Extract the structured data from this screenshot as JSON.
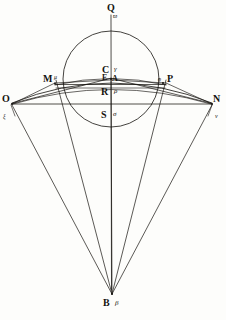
{
  "figure": {
    "background_color": "#fdfdfb",
    "ink_color": "#15130f",
    "width": 226,
    "height": 320
  },
  "points": {
    "Q": {
      "latin": "Q",
      "greek": "ϖ"
    },
    "C": {
      "latin": "C",
      "greek": "γ"
    },
    "E": {
      "latin": "E",
      "greek": ""
    },
    "A": {
      "latin": "A",
      "greek": ""
    },
    "M": {
      "latin": "M",
      "greek": "μ"
    },
    "P": {
      "latin": "P",
      "greek": "ϱ"
    },
    "R": {
      "latin": "R",
      "greek": "ρ"
    },
    "S": {
      "latin": "S",
      "greek": "σ"
    },
    "O": {
      "latin": "O",
      "greek": "ξ"
    },
    "N": {
      "latin": "N",
      "greek": "ν"
    },
    "B": {
      "latin": "B",
      "greek": "β"
    }
  },
  "labels": [
    {
      "id": "label-Q",
      "latin": "Q",
      "greek": "ϖ"
    },
    {
      "id": "label-C",
      "latin": "C",
      "greek": "γ"
    },
    {
      "id": "label-E",
      "latin": "E",
      "greek": ""
    },
    {
      "id": "label-A",
      "latin": "A",
      "greek": ""
    },
    {
      "id": "label-M",
      "latin": "M",
      "greek": "μ"
    },
    {
      "id": "label-P",
      "latin": "P",
      "greek": "ϱ"
    },
    {
      "id": "label-R",
      "latin": "R",
      "greek": "ρ"
    },
    {
      "id": "label-S",
      "latin": "S",
      "greek": "σ"
    },
    {
      "id": "label-O",
      "latin": "O",
      "greek": "ξ"
    },
    {
      "id": "label-N",
      "latin": "N",
      "greek": "ν"
    },
    {
      "id": "label-B",
      "latin": "B",
      "greek": "β"
    }
  ],
  "geometry": {
    "circle": {
      "cx": 111,
      "cy": 79,
      "r": 48
    },
    "vertical_axis": {
      "x": 111,
      "y1": 15,
      "y2": 298
    },
    "apex": {
      "x": 112,
      "y": 297
    },
    "horizontal_chord_ON": {
      "x1": 10,
      "y1": 104,
      "x2": 213,
      "y2": 104
    },
    "chord_MP": {
      "x1": 55,
      "y1": 84,
      "x2": 166,
      "y2": 84
    },
    "rays_from_apex": [
      {
        "name": "ray-B-O",
        "x": 10,
        "y": 104
      },
      {
        "name": "ray-B-M",
        "x": 55,
        "y": 80
      },
      {
        "name": "ray-B-C",
        "x": 111,
        "y": 76
      },
      {
        "name": "ray-B-P",
        "x": 166,
        "y": 80
      },
      {
        "name": "ray-B-N",
        "x": 213,
        "y": 104
      }
    ],
    "arcs": [
      {
        "name": "arc-outer-ON",
        "x1": 10,
        "y1": 103,
        "x2": 213,
        "y2": 103,
        "rx": 230,
        "ry": 175
      },
      {
        "name": "arc-mid-ON",
        "x1": 10,
        "y1": 104,
        "x2": 213,
        "y2": 104,
        "rx": 260,
        "ry": 230
      },
      {
        "name": "arc-MCP",
        "x1": 55,
        "y1": 85,
        "x2": 166,
        "y2": 85,
        "rx": 200,
        "ry": 200
      }
    ]
  }
}
